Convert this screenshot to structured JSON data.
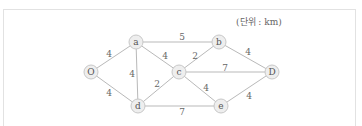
{
  "diagram": {
    "unit_label": "(단위 : km)",
    "nodes": [
      {
        "id": "O",
        "label": "O",
        "x": 91,
        "y": 72
      },
      {
        "id": "a",
        "label": "a",
        "x": 136,
        "y": 42
      },
      {
        "id": "b",
        "label": "b",
        "x": 219,
        "y": 42
      },
      {
        "id": "c",
        "label": "c",
        "x": 179,
        "y": 72
      },
      {
        "id": "D",
        "label": "D",
        "x": 272,
        "y": 72
      },
      {
        "id": "d",
        "label": "d",
        "x": 138,
        "y": 106
      },
      {
        "id": "e",
        "label": "e",
        "x": 221,
        "y": 106
      }
    ],
    "edges": [
      {
        "from": "O",
        "to": "a",
        "weight": "4",
        "lx": 109,
        "ly": 54
      },
      {
        "from": "O",
        "to": "d",
        "weight": "4",
        "lx": 109,
        "ly": 93
      },
      {
        "from": "a",
        "to": "d",
        "weight": "4",
        "lx": 132,
        "ly": 74
      },
      {
        "from": "a",
        "to": "b",
        "weight": "5",
        "lx": 182,
        "ly": 37
      },
      {
        "from": "a",
        "to": "c",
        "weight": "4",
        "lx": 165,
        "ly": 56
      },
      {
        "from": "d",
        "to": "c",
        "weight": "2",
        "lx": 157,
        "ly": 84
      },
      {
        "from": "c",
        "to": "b",
        "weight": "2",
        "lx": 195,
        "ly": 56
      },
      {
        "from": "c",
        "to": "D",
        "weight": "7",
        "lx": 225,
        "ly": 68
      },
      {
        "from": "c",
        "to": "e",
        "weight": "4",
        "lx": 206,
        "ly": 88
      },
      {
        "from": "d",
        "to": "e",
        "weight": "7",
        "lx": 182,
        "ly": 112
      },
      {
        "from": "b",
        "to": "D",
        "weight": "4",
        "lx": 248,
        "ly": 52
      },
      {
        "from": "e",
        "to": "D",
        "weight": "4",
        "lx": 249,
        "ly": 96
      }
    ]
  }
}
